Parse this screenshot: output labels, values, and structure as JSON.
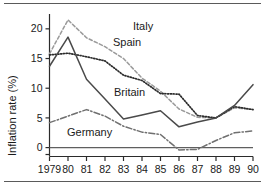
{
  "figure": {
    "name": "inflation-rate-line-chart",
    "has_top_rule": true,
    "has_bottom_rule": true,
    "rule_color": "#5a5a5a",
    "background": "#ffffff"
  },
  "chart_data": {
    "type": "line",
    "title": "",
    "subtitle": "",
    "xlabel": "",
    "ylabel": "Inflation rate (%)",
    "x": [
      "1979",
      "80",
      "81",
      "82",
      "83",
      "84",
      "85",
      "86",
      "87",
      "88",
      "89",
      "90"
    ],
    "categories": [
      "1979",
      "80",
      "81",
      "82",
      "83",
      "84",
      "85",
      "86",
      "87",
      "88",
      "89",
      "90"
    ],
    "xlim": [
      0,
      11
    ],
    "ylim": [
      -1.5,
      22.5
    ],
    "yticks": [
      0,
      5,
      10,
      15,
      20
    ],
    "ytick_labels": [
      "0",
      "5",
      "10",
      "15",
      "20"
    ],
    "grid": false,
    "legend_position": "inline-annotations",
    "zero_line": true,
    "series": [
      {
        "name": "Italy",
        "color": "#9a9a9a",
        "style": "dashed",
        "label_x": "84",
        "values": [
          15.8,
          21.5,
          18.5,
          17.0,
          15.0,
          11.7,
          9.5,
          6.5,
          5.1,
          5.0,
          6.7,
          6.4
        ]
      },
      {
        "name": "Spain",
        "color": "#2b2b2b",
        "style": "dotted",
        "label_x": "82",
        "values": [
          15.6,
          15.9,
          15.3,
          14.6,
          12.2,
          11.3,
          9.1,
          9.0,
          5.4,
          5.0,
          6.9,
          6.4
        ]
      },
      {
        "name": "Britain",
        "color": "#4a4a4a",
        "style": "solid",
        "label_x": "84",
        "values": [
          13.7,
          18.6,
          11.5,
          8.2,
          4.8,
          5.5,
          6.2,
          3.5,
          4.3,
          5.0,
          7.1,
          10.6
        ]
      },
      {
        "name": "Germany",
        "color": "#707070",
        "style": "dashdot",
        "label_x": "83",
        "values": [
          4.2,
          5.3,
          6.4,
          5.3,
          3.6,
          2.6,
          2.2,
          -0.4,
          -0.3,
          1.2,
          2.5,
          2.8
        ]
      }
    ]
  },
  "axis": {
    "y_title": "Inflation rate (%)",
    "ytick_labels": [
      "20",
      "15",
      "10",
      "5",
      "0"
    ],
    "xtick_labels": [
      "1979",
      "80",
      "81",
      "82",
      "83",
      "84",
      "85",
      "86",
      "87",
      "88",
      "89",
      "90"
    ]
  },
  "annotations": [
    {
      "name": "italy-label",
      "text": "Italy"
    },
    {
      "name": "spain-label",
      "text": "Spain"
    },
    {
      "name": "britain-label",
      "text": "Britain"
    },
    {
      "name": "germany-label",
      "text": "Germany"
    }
  ]
}
